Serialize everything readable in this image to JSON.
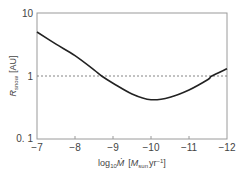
{
  "chart_data": {
    "type": "line",
    "title": "",
    "xlabel": "log10 Ṁ [Msun yr^-1]",
    "ylabel": "R_snow [AU]",
    "xlabel_parts": {
      "pre": "log",
      "sub": "10",
      "var": "Ṁ",
      "unit_open": "[",
      "unit_m": "M",
      "unit_sub": "sun",
      "unit_yr": "yr",
      "unit_exp": "−1",
      "unit_close": "]"
    },
    "ylabel_parts": {
      "var": "R",
      "sub": "snow",
      "unit": "[AU]"
    },
    "xlim": [
      -7,
      -12
    ],
    "ylim": [
      0.1,
      10
    ],
    "yscale": "log",
    "x_ticks": [
      "−7",
      "−8",
      "−9",
      "−10",
      "−11",
      "−12"
    ],
    "y_ticks": [
      "0. 1",
      "1",
      "10"
    ],
    "grid": false,
    "reference_line": {
      "y": 1,
      "style": "dashed"
    },
    "series": [
      {
        "name": "R_snow",
        "x": [
          -7,
          -7.5,
          -8,
          -8.5,
          -8.7,
          -9,
          -9.5,
          -10,
          -10.5,
          -11,
          -11.5,
          -11.6,
          -12
        ],
        "y": [
          5.0,
          3.2,
          2.1,
          1.25,
          1.0,
          0.77,
          0.52,
          0.42,
          0.46,
          0.6,
          0.88,
          1.0,
          1.3
        ]
      }
    ]
  }
}
